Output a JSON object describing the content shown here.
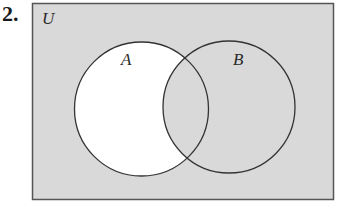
{
  "problem": {
    "number": "2."
  },
  "diagram": {
    "type": "venn",
    "universe_label": "U",
    "sets": [
      {
        "label": "A"
      },
      {
        "label": "B"
      }
    ],
    "shaded_region": "complement of (A minus B): everything shaded except the part of A outside B",
    "colors": {
      "shade": "#d9d9d9",
      "unshaded": "#ffffff",
      "stroke": "#333333"
    }
  }
}
